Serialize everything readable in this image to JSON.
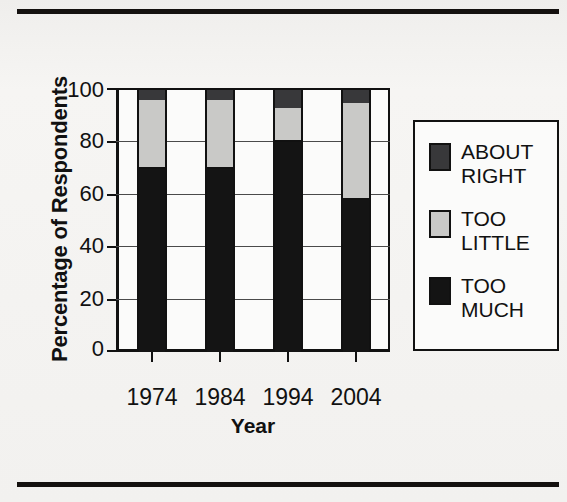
{
  "chart_data": {
    "type": "bar",
    "stacked": true,
    "title": "",
    "xlabel": "Year",
    "ylabel": "Percentage of Respondents",
    "categories": [
      "1974",
      "1984",
      "1994",
      "2004"
    ],
    "series": [
      {
        "name": "TOO MUCH",
        "color": "#141414",
        "values": [
          70,
          70,
          80,
          58
        ]
      },
      {
        "name": "TOO LITTLE",
        "color": "#c9c9c7",
        "values": [
          26,
          26,
          13,
          37
        ]
      },
      {
        "name": "ABOUT RIGHT",
        "color": "#38383a",
        "values": [
          4,
          4,
          7,
          5
        ]
      }
    ],
    "ylim": [
      0,
      100
    ],
    "yticks": [
      "0",
      "20",
      "40",
      "60",
      "80",
      "100"
    ],
    "grid": true,
    "legend_position": "right",
    "legend_entries": [
      "ABOUT RIGHT",
      "TOO LITTLE",
      "TOO MUCH"
    ]
  },
  "axis": {
    "y_title": "Percentage of Respondents",
    "x_title": "Year",
    "y_tick_labels": [
      "100",
      "80",
      "60",
      "40",
      "20",
      "0"
    ],
    "x_tick_labels": [
      "1974",
      "1984",
      "1994",
      "2004"
    ]
  },
  "legend": {
    "items": [
      {
        "label": "ABOUT\nRIGHT",
        "swatch": "about-right-swatch"
      },
      {
        "label": "TOO\nLITTLE",
        "swatch": "too-little-swatch"
      },
      {
        "label": "TOO\nMUCH",
        "swatch": "too-much-swatch"
      }
    ]
  },
  "colors": {
    "about_right": "#38383a",
    "too_little": "#c9c9c7",
    "too_much": "#141414",
    "axis": "#111111",
    "paper": "#f4f3f1"
  }
}
